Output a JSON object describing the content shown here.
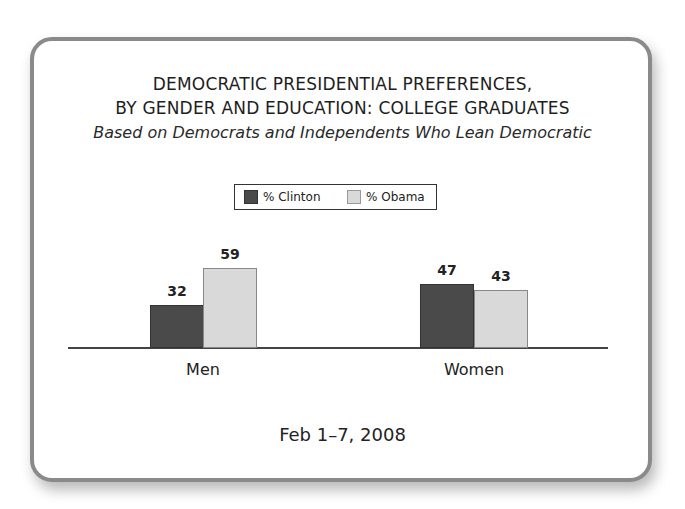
{
  "title_line1": "DEMOCRATIC PRESIDENTIAL PREFERENCES,",
  "title_line2": "BY GENDER AND EDUCATION: COLLEGE GRADUATES",
  "subtitle": "Based on Democrats and Independents Who Lean Democratic",
  "legend": [
    {
      "label": "% Clinton",
      "color": "#4a4a4a"
    },
    {
      "label": "% Obama",
      "color": "#d9d9d9"
    }
  ],
  "footer_date": "Feb 1–7, 2008",
  "chart_data": {
    "type": "bar",
    "subtitle": "Based on Democrats and Independents Who Lean Democratic",
    "categories": [
      "Men",
      "Women"
    ],
    "series": [
      {
        "name": "% Clinton",
        "values": [
          32,
          47
        ],
        "color": "#4a4a4a"
      },
      {
        "name": "% Obama",
        "values": [
          59,
          43
        ],
        "color": "#d9d9d9"
      }
    ],
    "data_labels": [
      [
        "32",
        "59"
      ],
      [
        "47",
        "43"
      ]
    ],
    "xlabel": "",
    "ylabel": "",
    "ylim": [
      0,
      100
    ],
    "grid": false,
    "legend_position": "top-center",
    "annotation": "Feb 1–7, 2008"
  }
}
